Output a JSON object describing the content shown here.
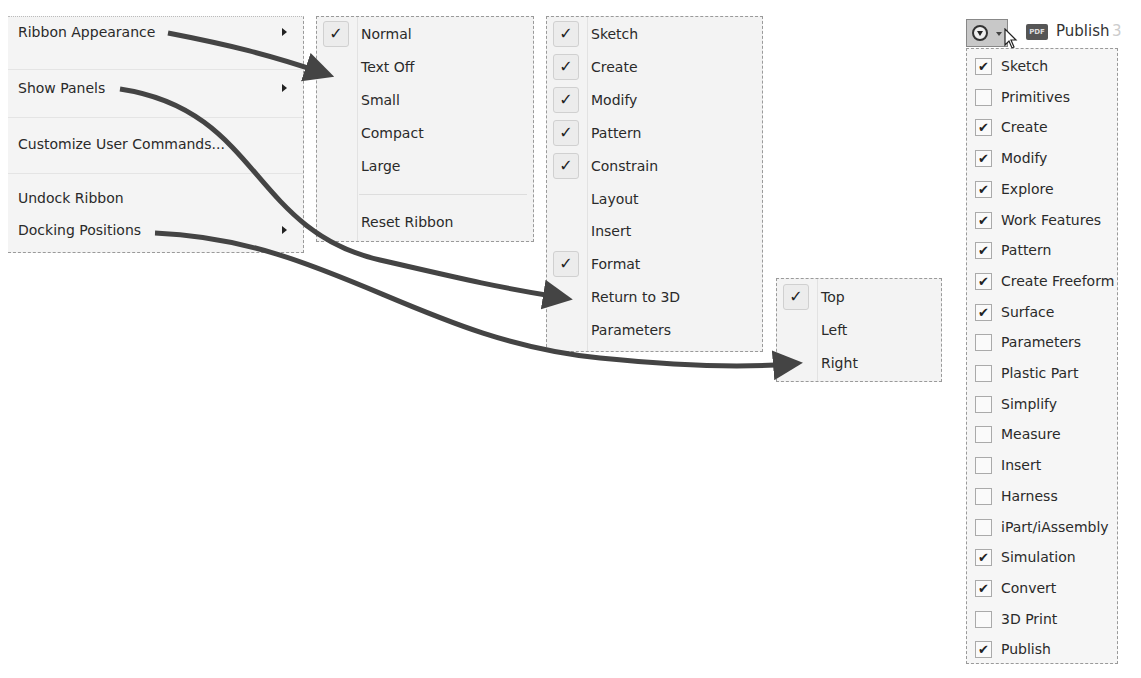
{
  "context_menu": {
    "items": [
      {
        "label": "Ribbon Appearance",
        "submenu": true
      },
      {
        "label": "Show Panels",
        "submenu": true
      },
      {
        "label": "Customize User Commands...",
        "submenu": false
      },
      {
        "label": "Undock Ribbon",
        "submenu": false
      },
      {
        "label": "Docking Positions",
        "submenu": true
      }
    ]
  },
  "ribbon_appearance_menu": {
    "items": [
      {
        "label": "Normal",
        "checked": true
      },
      {
        "label": "Text Off",
        "checked": false
      },
      {
        "label": "Small",
        "checked": false
      },
      {
        "label": "Compact",
        "checked": false
      },
      {
        "label": "Large",
        "checked": false
      }
    ],
    "reset_label": "Reset Ribbon"
  },
  "show_panels_menu": {
    "items": [
      {
        "label": "Sketch",
        "checked": true
      },
      {
        "label": "Create",
        "checked": true
      },
      {
        "label": "Modify",
        "checked": true
      },
      {
        "label": "Pattern",
        "checked": true
      },
      {
        "label": "Constrain",
        "checked": true
      },
      {
        "label": "Layout",
        "checked": false
      },
      {
        "label": "Insert",
        "checked": false
      },
      {
        "label": "Format",
        "checked": true
      },
      {
        "label": "Return to 3D",
        "checked": false
      },
      {
        "label": "Parameters",
        "checked": false
      }
    ]
  },
  "docking_positions_menu": {
    "items": [
      {
        "label": "Top",
        "checked": true
      },
      {
        "label": "Left",
        "checked": false
      },
      {
        "label": "Right",
        "checked": false
      }
    ]
  },
  "toolbar": {
    "pdf_icon_text": "PDF",
    "publish_label": "Publish",
    "publish_suffix": "3"
  },
  "panels_dropdown": {
    "items": [
      {
        "label": "Sketch",
        "checked": true
      },
      {
        "label": "Primitives",
        "checked": false
      },
      {
        "label": "Create",
        "checked": true
      },
      {
        "label": "Modify",
        "checked": true
      },
      {
        "label": "Explore",
        "checked": true
      },
      {
        "label": "Work Features",
        "checked": true
      },
      {
        "label": "Pattern",
        "checked": true
      },
      {
        "label": "Create Freeform",
        "checked": true
      },
      {
        "label": "Surface",
        "checked": true
      },
      {
        "label": "Parameters",
        "checked": false
      },
      {
        "label": "Plastic Part",
        "checked": false
      },
      {
        "label": "Simplify",
        "checked": false
      },
      {
        "label": "Measure",
        "checked": false
      },
      {
        "label": "Insert",
        "checked": false
      },
      {
        "label": "Harness",
        "checked": false
      },
      {
        "label": "iPart/iAssembly",
        "checked": false
      },
      {
        "label": "Simulation",
        "checked": true
      },
      {
        "label": "Convert",
        "checked": true
      },
      {
        "label": "3D Print",
        "checked": false
      },
      {
        "label": "Publish",
        "checked": true
      }
    ]
  },
  "check_glyph": "✓",
  "box_check_glyph": "✔",
  "colors": {
    "arrow": "#444444",
    "menu_bg": "#f3f3f3",
    "border": "#9a9a9a"
  }
}
